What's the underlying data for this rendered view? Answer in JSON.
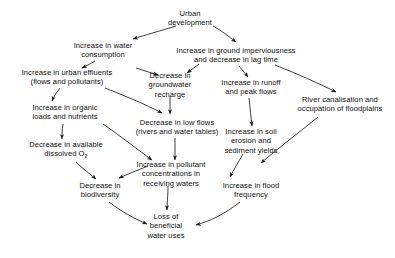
{
  "diagram": {
    "type": "flow-diagram",
    "background_color": "#ffffff",
    "text_color": "#111111",
    "arrow_color": "#1a1a1a",
    "nodes": [
      {
        "id": "urban-development",
        "label": "Urban\ndevelopment",
        "x": 190,
        "y": 18
      },
      {
        "id": "water-consumption",
        "label": "Increase in water\nconsumption",
        "x": 103,
        "y": 50
      },
      {
        "id": "ground-imperviousness",
        "label": "Increase in ground imperviousness\nand decrease in lag time",
        "x": 236,
        "y": 55
      },
      {
        "id": "urban-effluents",
        "label": "Increase in urban effluents\n(flows and pollutants)",
        "x": 67,
        "y": 77
      },
      {
        "id": "groundwater-recharge",
        "label": "Decrease in\ngroundwater\nrecharge",
        "x": 170,
        "y": 85
      },
      {
        "id": "runoff-peak-flows",
        "label": "Increase in runoff\nand peak flows",
        "x": 251,
        "y": 87
      },
      {
        "id": "river-canalisation",
        "label": "River canalisation and\noccupation of floodplains",
        "x": 340,
        "y": 104
      },
      {
        "id": "organic-loads",
        "label": "Increase in organic\nloads and nutrients",
        "x": 65,
        "y": 112
      },
      {
        "id": "low-flows",
        "label": "Decrease in low flows\n(rivers and water tables)",
        "x": 177,
        "y": 127
      },
      {
        "id": "soil-erosion",
        "label": "Increase in soil\nerosion and\nsediment yields",
        "x": 251,
        "y": 141
      },
      {
        "id": "dissolved-oxygen",
        "label": "Decrease in available\ndissolved O₂",
        "x": 66,
        "y": 150
      },
      {
        "id": "pollutant-concentration",
        "label": "Increase in pollutant\nconcentrations in\nreceiving waters",
        "x": 171,
        "y": 174
      },
      {
        "id": "flood-frequency",
        "label": "Increase in flood\nfrequency",
        "x": 251,
        "y": 190
      },
      {
        "id": "biodiversity",
        "label": "Decrease in\nbiodiversity",
        "x": 100,
        "y": 190
      },
      {
        "id": "loss-water-uses",
        "label": "Loss of\nbeneficial\nwater uses",
        "x": 166,
        "y": 226
      }
    ],
    "edges": [
      {
        "from": "urban-development",
        "to": "water-consumption",
        "path": "M 176 26 C 160 31, 145 35, 133 39"
      },
      {
        "from": "urban-development",
        "to": "ground-imperviousness",
        "path": "M 213 26 C 222 31, 228 36, 236 42"
      },
      {
        "from": "water-consumption",
        "to": "urban-effluents",
        "path": "M 95 61 C 90 64, 86 66, 82 68"
      },
      {
        "from": "water-consumption",
        "to": "groundwater-recharge",
        "path": "M 136 68 C 145 71, 152 73, 158 75"
      },
      {
        "from": "ground-imperviousness",
        "to": "groundwater-recharge",
        "path": "M 199 64 C 195 67, 191 70, 187 73"
      },
      {
        "from": "ground-imperviousness",
        "to": "runoff-peak-flows",
        "path": "M 239 66 C 242 70, 245 73, 248 77"
      },
      {
        "from": "ground-imperviousness",
        "to": "river-canalisation",
        "path": "M 275 65 C 300 75, 320 84, 336 92"
      },
      {
        "from": "urban-effluents",
        "to": "organic-loads",
        "path": "M 60 88 C 57 92, 54 96, 52 101"
      },
      {
        "from": "urban-effluents",
        "to": "low-flows",
        "path": "M 105 88 C 125 96, 145 104, 162 113"
      },
      {
        "from": "groundwater-recharge",
        "to": "low-flows",
        "path": "M 170 96 C 170 103, 170 108, 170 114"
      },
      {
        "from": "runoff-peak-flows",
        "to": "soil-erosion",
        "path": "M 249 98 C 250 108, 251 117, 252 126"
      },
      {
        "from": "organic-loads",
        "to": "dissolved-oxygen",
        "path": "M 63 124 C 62 130, 62 134, 62 139"
      },
      {
        "from": "organic-loads",
        "to": "pollutant-concentration",
        "path": "M 103 124 C 122 137, 138 150, 152 160"
      },
      {
        "from": "low-flows",
        "to": "pollutant-concentration",
        "path": "M 175 138 C 175 146, 175 152, 175 160"
      },
      {
        "from": "soil-erosion",
        "to": "flood-frequency",
        "path": "M 243 154 C 238 163, 234 169, 230 177"
      },
      {
        "from": "dissolved-oxygen",
        "to": "biodiversity",
        "path": "M 76 162 C 83 169, 90 174, 96 179"
      },
      {
        "from": "pollutant-concentration",
        "to": "biodiversity",
        "path": "M 148 166 C 138 170, 128 174, 119 178"
      },
      {
        "from": "river-canalisation",
        "to": "flood-frequency",
        "path": "M 318 117 C 297 134, 276 150, 261 163"
      },
      {
        "from": "biodiversity",
        "to": "loss-water-uses",
        "path": "M 109 202 C 122 212, 135 219, 147 224"
      },
      {
        "from": "pollutant-concentration",
        "to": "loss-water-uses",
        "path": "M 168 186 C 168 196, 167 203, 167 210"
      },
      {
        "from": "flood-frequency",
        "to": "loss-water-uses",
        "path": "M 240 202 C 225 214, 210 221, 196 225"
      }
    ]
  }
}
